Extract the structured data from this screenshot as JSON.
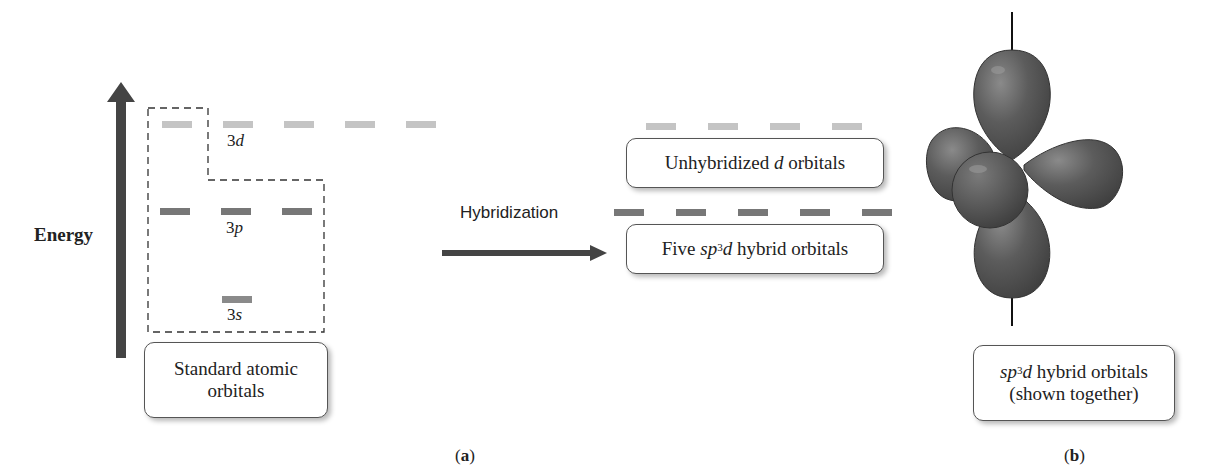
{
  "diagram": {
    "panel_a": {
      "label_open": "(",
      "label": "a",
      "label_close": ")",
      "energy_axis_label": "Energy",
      "levels": {
        "3d": {
          "orbital": "3",
          "letter": "d",
          "count": 5,
          "color": "#c4c4c4"
        },
        "3p": {
          "orbital": "3",
          "letter": "p",
          "count": 3,
          "color": "#777777"
        },
        "3s": {
          "orbital": "3",
          "letter": "s",
          "count": 1,
          "color": "#8a8a8a"
        }
      },
      "standard_box": {
        "line1": "Standard atomic",
        "line2": "orbitals"
      },
      "arrow_label": "Hybridization",
      "unhybridized_box": {
        "prefix": "Unhybridized ",
        "italic": "d",
        "suffix": " orbitals"
      },
      "unhybridized_count": 4,
      "hybrid_box": {
        "prefix": "Five ",
        "sp": "sp",
        "sup": "3",
        "d": "d",
        "suffix": " hybrid orbitals"
      },
      "hybrid_count": 5
    },
    "panel_b": {
      "label_open": "(",
      "label": "b",
      "label_close": ")",
      "caption": {
        "sp": "sp",
        "sup": "3",
        "d": "d",
        "line1_suffix": " hybrid orbitals",
        "line2": "(shown together)"
      }
    },
    "colors": {
      "arrow": "#444444",
      "lobe": "#555555",
      "dashed_box": "#333333"
    }
  }
}
